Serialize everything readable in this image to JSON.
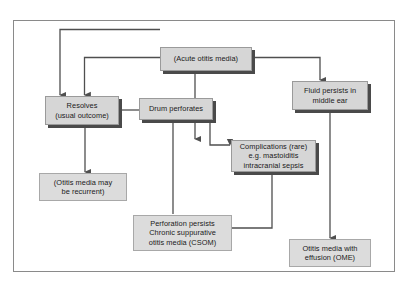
{
  "figure": {
    "border_color": "#8a8a8a",
    "node_fill": "#d6d6d6",
    "node_border": "#9a9a9a",
    "shadow_color": "#4a4a4a",
    "connector_color": "#4f4f4f",
    "background": "#ffffff"
  },
  "nodes": {
    "acute_otitis_media": {
      "lines": [
        "(Acute otitis media)"
      ]
    },
    "resolves": {
      "lines": [
        "Resolves",
        "(usual outcome)"
      ]
    },
    "drum_perforates": {
      "lines": [
        "Drum perforates"
      ]
    },
    "fluid_persists": {
      "lines": [
        "Fluid persists in",
        "middle ear"
      ]
    },
    "complications": {
      "lines": [
        "Complications (rare)",
        "e.g. mastoiditis",
        "intracranial sepsis"
      ]
    },
    "recurrent": {
      "lines": [
        "(Otitis media may",
        "be recurrent)"
      ]
    },
    "csom": {
      "lines": [
        "Perforation persists",
        "Chronic suppurative",
        "otitis media (CSOM)"
      ]
    },
    "ome": {
      "lines": [
        "Otitis media with",
        "effusion (OME)"
      ]
    }
  },
  "edges": [
    {
      "from": "acute_otitis_media",
      "to": "resolves",
      "arrow": true
    },
    {
      "from": "acute_otitis_media",
      "to": "drum_perforates",
      "arrow": true
    },
    {
      "from": "acute_otitis_media",
      "to": "complications",
      "arrow": true
    },
    {
      "from": "acute_otitis_media",
      "to": "fluid_persists",
      "arrow": true
    },
    {
      "from": "drum_perforates",
      "to": "resolves",
      "arrow": true
    },
    {
      "from": "drum_perforates",
      "to": "complications",
      "arrow": true
    },
    {
      "from": "drum_perforates",
      "to": "csom",
      "arrow": false
    },
    {
      "from": "resolves",
      "to": "recurrent",
      "arrow": true
    },
    {
      "from": "csom",
      "to": "complications",
      "arrow": true
    },
    {
      "from": "fluid_persists",
      "to": "ome",
      "arrow": true
    }
  ]
}
